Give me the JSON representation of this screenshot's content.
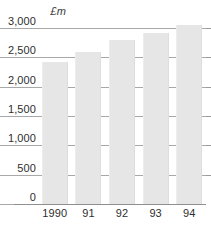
{
  "chart_data": {
    "type": "bar",
    "title": "",
    "subtitle": "",
    "unit_label": "£m",
    "xlabel": "",
    "ylabel": "£m",
    "categories": [
      "1990",
      "91",
      "92",
      "93",
      "94"
    ],
    "values": [
      2420,
      2590,
      2800,
      2920,
      3050
    ],
    "series": [
      {
        "name": "",
        "values": [
          2420,
          2590,
          2800,
          2920,
          3050
        ]
      }
    ],
    "ylim": [
      0,
      3000
    ],
    "ytick_values": [
      0,
      500,
      1000,
      1500,
      2000,
      2500,
      3000
    ],
    "ytick_labels": [
      "0",
      "500",
      "1,000",
      "1,500",
      "2,000",
      "2,500",
      "3,000"
    ],
    "grid": true,
    "grid_orientation": "horizontal",
    "legend": false,
    "legend_position": "none",
    "annotations": [],
    "colors": {
      "bar_fill": "#e6e6e6",
      "gridline": "#a8a8a8",
      "axis": "#8f8f8f",
      "text": "#2e2e2e",
      "background": "#ffffff"
    }
  }
}
